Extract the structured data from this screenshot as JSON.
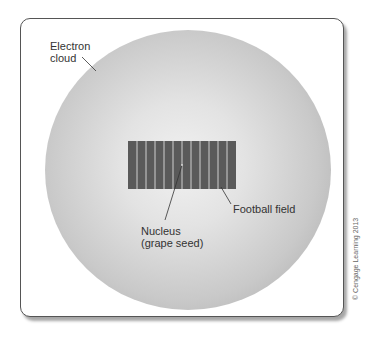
{
  "diagram": {
    "labels": {
      "electron_cloud": [
        "Electron",
        "cloud"
      ],
      "football_field": "Football field",
      "nucleus": [
        "Nucleus",
        "(grape seed)"
      ]
    },
    "football_field": {
      "stripes": 12,
      "color": "#5a5a5a",
      "line_color": "#cfcfcf"
    },
    "copyright": "© Cengage Learning 2013"
  }
}
